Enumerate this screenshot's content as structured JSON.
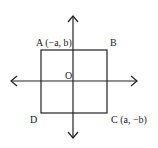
{
  "diagram": {
    "type": "coordinate-plane-square",
    "origin_label": "O",
    "vertices": {
      "A": {
        "label": "A",
        "coords": "(−a, b)",
        "full": "A (−a, b)"
      },
      "B": {
        "label": "B",
        "coords": "",
        "full": "B"
      },
      "C": {
        "label": "C",
        "coords": "(a, −b)",
        "full": "C (a, −b)"
      },
      "D": {
        "label": "D",
        "coords": "",
        "full": "D"
      }
    },
    "colors": {
      "stroke": "#222222",
      "background": "#ffffff"
    }
  }
}
